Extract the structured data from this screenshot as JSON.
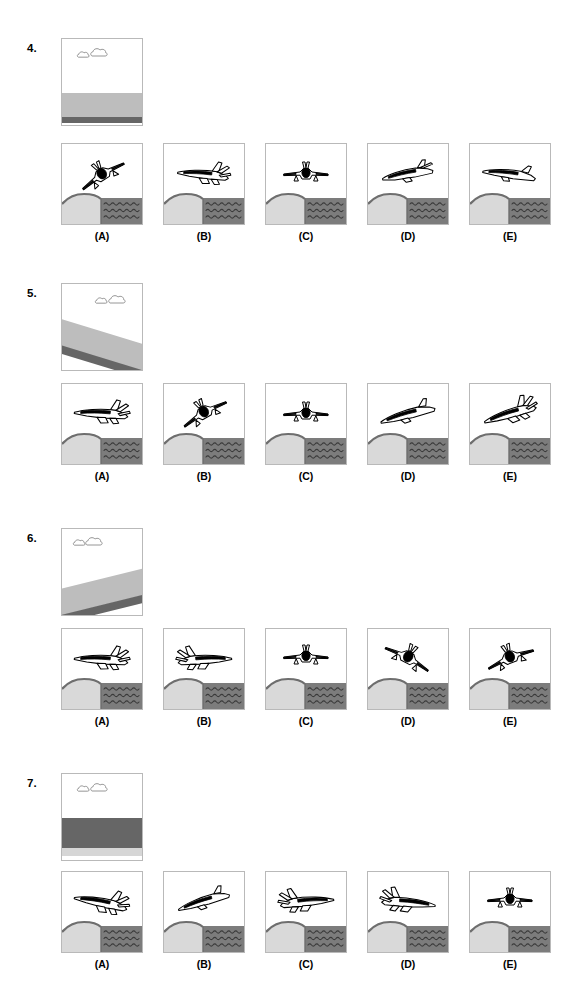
{
  "page": {
    "width": 585,
    "height": 998,
    "background": "#ffffff",
    "kind": "printed-test-page"
  },
  "palette": {
    "land_fill": "#d9d9d9",
    "land_edge": "#6e6e6e",
    "water_fill": "#7c7c7c",
    "water_wave": "#3a3a3a",
    "sky": "#ffffff",
    "frame_border": "#b9b9b9",
    "ink": "#000000",
    "band_gray": "#bdbdbd",
    "band_dark": "#666666",
    "band_light": "#e4e4e4"
  },
  "option_letters": [
    "(A)",
    "(B)",
    "(C)",
    "(D)",
    "(E)"
  ],
  "questions": [
    {
      "number": "4.",
      "top": 38,
      "prompt": {
        "name": "horizon-view-level-high",
        "description": "level horizon low in frame, clouds upper area",
        "clouds": [
          {
            "cx": 22,
            "cy": 16,
            "s": 0.72
          },
          {
            "cx": 38,
            "cy": 14,
            "s": 1.0
          }
        ],
        "bands": [
          {
            "y": 54,
            "h": 24,
            "fill": "#bdbdbd"
          },
          {
            "y": 78,
            "h": 6,
            "fill": "#666666"
          }
        ],
        "horizon_tilt_deg": 0
      },
      "options_top": 143,
      "options": [
        {
          "letter": "(A)",
          "name": "aircraft-rolled-right-nose-down-steep",
          "aircraft": {
            "type": "jet-oblique-front",
            "rotate": -32,
            "cx": 40,
            "cy": 30,
            "scale": 1.0
          }
        },
        {
          "letter": "(B)",
          "name": "aircraft-climbing-left-inverted-view",
          "aircraft": {
            "type": "jet-three-quarter-left",
            "rotate": 8,
            "cx": 40,
            "cy": 28,
            "scale": 1.0
          }
        },
        {
          "letter": "(C)",
          "name": "aircraft-level-head-on",
          "aircraft": {
            "type": "jet-head-on",
            "rotate": 0,
            "cx": 40,
            "cy": 30,
            "scale": 1.0
          }
        },
        {
          "letter": "(D)",
          "name": "aircraft-level-side-profile-right",
          "aircraft": {
            "type": "jet-side-profile",
            "rotate": -8,
            "cx": 40,
            "cy": 29,
            "scale": 1.0
          }
        },
        {
          "letter": "(E)",
          "name": "aircraft-shallow-dive-profile",
          "aircraft": {
            "type": "jet-side-slim",
            "rotate": 10,
            "cx": 40,
            "cy": 29,
            "scale": 1.0
          }
        }
      ]
    },
    {
      "number": "5.",
      "top": 283,
      "prompt": {
        "name": "horizon-view-banked-right",
        "description": "horizon tilted down to the right, clouds upper right",
        "clouds": [
          {
            "cx": 40,
            "cy": 17,
            "s": 0.72
          },
          {
            "cx": 56,
            "cy": 16,
            "s": 1.0
          }
        ],
        "horizon_tilt_deg": 17,
        "bands": [
          {
            "y": 48,
            "h": 26,
            "fill": "#bdbdbd",
            "tilt": 17
          },
          {
            "y": 74,
            "h": 8,
            "fill": "#666666",
            "tilt": 17
          }
        ]
      },
      "options_top": 383,
      "options": [
        {
          "letter": "(A)",
          "name": "aircraft-climbing-right-three-quarter",
          "aircraft": {
            "type": "jet-three-quarter-left",
            "rotate": 6,
            "cx": 40,
            "cy": 27,
            "scale": 1.05
          }
        },
        {
          "letter": "(B)",
          "name": "aircraft-steep-dive-right-head-on",
          "aircraft": {
            "type": "jet-oblique-front",
            "rotate": -30,
            "cx": 40,
            "cy": 28,
            "scale": 1.0
          }
        },
        {
          "letter": "(C)",
          "name": "aircraft-level-head-on",
          "aircraft": {
            "type": "jet-head-on",
            "rotate": 0,
            "cx": 40,
            "cy": 30,
            "scale": 1.0
          }
        },
        {
          "letter": "(D)",
          "name": "aircraft-shallow-climb-profile",
          "aircraft": {
            "type": "jet-side-slim",
            "rotate": -12,
            "cx": 40,
            "cy": 29,
            "scale": 1.05
          }
        },
        {
          "letter": "(E)",
          "name": "aircraft-banked-three-quarter-left",
          "aircraft": {
            "type": "jet-three-quarter-left",
            "rotate": -14,
            "cx": 40,
            "cy": 27,
            "scale": 1.05
          }
        }
      ]
    },
    {
      "number": "6.",
      "top": 528,
      "prompt": {
        "name": "horizon-view-banked-left",
        "description": "horizon tilted up to the right, clouds upper left",
        "clouds": [
          {
            "cx": 18,
            "cy": 14,
            "s": 0.72
          },
          {
            "cx": 33,
            "cy": 13,
            "s": 1.0
          }
        ],
        "horizon_tilt_deg": -14,
        "bands": [
          {
            "y": 50,
            "h": 26,
            "fill": "#bdbdbd",
            "tilt": -14
          },
          {
            "y": 76,
            "h": 8,
            "fill": "#666666",
            "tilt": -14
          }
        ]
      },
      "options_top": 628,
      "options": [
        {
          "letter": "(A)",
          "name": "aircraft-three-quarter-left-level",
          "aircraft": {
            "type": "jet-three-quarter-left",
            "rotate": 6,
            "cx": 40,
            "cy": 28,
            "scale": 1.05
          }
        },
        {
          "letter": "(B)",
          "name": "aircraft-three-quarter-right-level",
          "aircraft": {
            "type": "jet-three-quarter-right",
            "rotate": -6,
            "cx": 40,
            "cy": 28,
            "scale": 1.05
          }
        },
        {
          "letter": "(C)",
          "name": "aircraft-level-head-on",
          "aircraft": {
            "type": "jet-head-on",
            "rotate": 0,
            "cx": 40,
            "cy": 28,
            "scale": 1.0
          }
        },
        {
          "letter": "(D)",
          "name": "aircraft-descending-right-head-on",
          "aircraft": {
            "type": "jet-oblique-front",
            "rotate": 28,
            "cx": 40,
            "cy": 28,
            "scale": 1.0
          }
        },
        {
          "letter": "(E)",
          "name": "aircraft-descending-left-head-on",
          "aircraft": {
            "type": "jet-oblique-front",
            "rotate": -22,
            "cx": 40,
            "cy": 28,
            "scale": 1.0
          }
        }
      ]
    },
    {
      "number": "7.",
      "top": 773,
      "prompt": {
        "name": "horizon-view-inverted",
        "description": "dark band across middle with light strip at bottom, clouds at top",
        "clouds": [
          {
            "cx": 22,
            "cy": 15,
            "s": 0.72
          },
          {
            "cx": 38,
            "cy": 14,
            "s": 1.0
          }
        ],
        "horizon_tilt_deg": 0,
        "bands": [
          {
            "y": 44,
            "h": 30,
            "fill": "#666666"
          },
          {
            "y": 74,
            "h": 8,
            "fill": "#d6d6d6"
          }
        ]
      },
      "options_top": 871,
      "options": [
        {
          "letter": "(A)",
          "name": "aircraft-three-quarter-left-descending",
          "aircraft": {
            "type": "jet-three-quarter-left",
            "rotate": 14,
            "cx": 40,
            "cy": 28,
            "scale": 1.05
          }
        },
        {
          "letter": "(B)",
          "name": "aircraft-climbing-profile",
          "aircraft": {
            "type": "jet-side-slim",
            "rotate": -14,
            "cx": 40,
            "cy": 28,
            "scale": 1.0
          }
        },
        {
          "letter": "(C)",
          "name": "aircraft-three-quarter-right-climbing",
          "aircraft": {
            "type": "jet-three-quarter-right",
            "rotate": -8,
            "cx": 40,
            "cy": 27,
            "scale": 1.05
          }
        },
        {
          "letter": "(D)",
          "name": "aircraft-three-quarter-right-level",
          "aircraft": {
            "type": "jet-three-quarter-right",
            "rotate": 2,
            "cx": 40,
            "cy": 28,
            "scale": 1.05
          }
        },
        {
          "letter": "(E)",
          "name": "aircraft-level-head-on",
          "aircraft": {
            "type": "jet-head-on",
            "rotate": 0,
            "cx": 40,
            "cy": 28,
            "scale": 1.0
          }
        }
      ]
    }
  ],
  "option_x_positions": [
    61,
    163,
    265,
    367,
    469
  ],
  "scene": {
    "name": "land-and-water-horizon",
    "land_hill_description": "rounded light-gray hill occupying left half",
    "water_description": "dark gray water on right half with wavy lines",
    "ground_top_y": 54
  }
}
